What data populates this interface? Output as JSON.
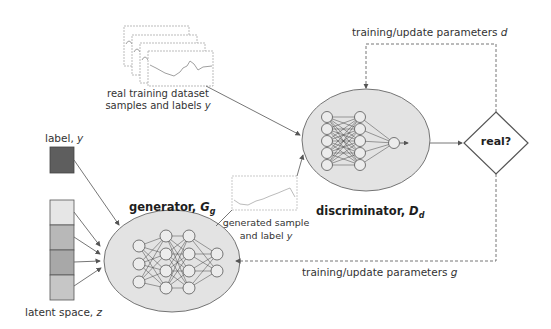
{
  "diagram": {
    "type": "conditional GAN architecture",
    "real_data": {
      "label_line1": "real training dataset",
      "label_line2_prefix": "samples and labels ",
      "label_line2_var": "y"
    },
    "label_input": {
      "text": "label, ",
      "var": "y"
    },
    "latent_input": {
      "text": "latent space, ",
      "var": "z",
      "cells": 4
    },
    "generator": {
      "name": "generator, ",
      "symbol": "G",
      "subscript": "g"
    },
    "discriminator": {
      "name": "discriminator, ",
      "symbol": "D",
      "subscript": "d"
    },
    "generated": {
      "line1": "generated sample",
      "line2_prefix": "and label ",
      "line2_var": "y"
    },
    "decision": {
      "text": "real?"
    },
    "feedback_d": {
      "text": "training/update parameters ",
      "var": "d"
    },
    "feedback_g": {
      "text": "training/update parameters ",
      "var": "g"
    },
    "colors": {
      "ellipse_fill": "#e3e3e3",
      "label_box": "#5e5e5e",
      "latent_light": "#e6e6e6",
      "latent_mid": "#b8b8b8",
      "latent_dark": "#a8a8a8",
      "stroke": "#555555"
    }
  }
}
